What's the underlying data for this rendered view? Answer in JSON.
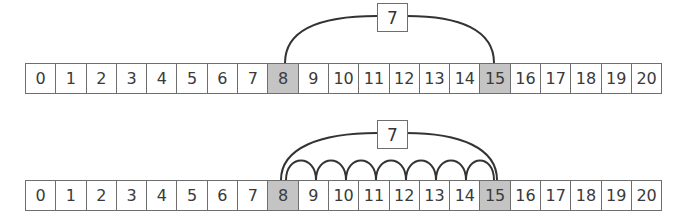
{
  "diagrams": [
    {
      "name": "single-jump",
      "cells": [
        "0",
        "1",
        "2",
        "3",
        "4",
        "5",
        "6",
        "7",
        "8",
        "9",
        "10",
        "11",
        "12",
        "13",
        "14",
        "15",
        "16",
        "17",
        "18",
        "19",
        "20"
      ],
      "highlighted": [
        8,
        15
      ],
      "jump_label": "7",
      "hops": 1
    },
    {
      "name": "unit-hops",
      "cells": [
        "0",
        "1",
        "2",
        "3",
        "4",
        "5",
        "6",
        "7",
        "8",
        "9",
        "10",
        "11",
        "12",
        "13",
        "14",
        "15",
        "16",
        "17",
        "18",
        "19",
        "20"
      ],
      "highlighted": [
        8,
        15
      ],
      "jump_label": "7",
      "hops": 7
    }
  ],
  "colors": {
    "highlight": "#c4c4c4",
    "stroke": "#333333",
    "border": "#6e6e6e"
  }
}
